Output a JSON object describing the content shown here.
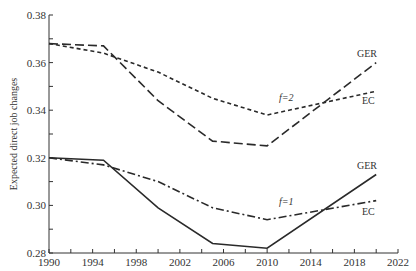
{
  "chart_data": {
    "type": "line",
    "title": "",
    "xlabel": "",
    "ylabel": "Expected direct job changes",
    "xlim": [
      1990,
      2022
    ],
    "ylim": [
      0.28,
      0.38
    ],
    "grid": false,
    "x_ticks": [
      "1990",
      "1994",
      "1998",
      "2002",
      "2006",
      "2010",
      "2014",
      "2018",
      "2022"
    ],
    "y_ticks": [
      "0.28",
      "0.30",
      "0.32",
      "0.34",
      "0.36",
      "0.38"
    ],
    "x": [
      1990,
      1995,
      2000,
      2005,
      2010,
      2020
    ],
    "series": [
      {
        "name": "GER (f=2)",
        "group": "f=2",
        "style": "long-dash",
        "values": [
          0.368,
          0.367,
          0.344,
          0.327,
          0.325,
          0.36
        ]
      },
      {
        "name": "EC (f=2)",
        "group": "f=2",
        "style": "short-dash",
        "values": [
          0.368,
          0.364,
          0.356,
          0.345,
          0.338,
          0.348
        ]
      },
      {
        "name": "GER (f=1)",
        "group": "f=1",
        "style": "solid",
        "values": [
          0.32,
          0.319,
          0.299,
          0.284,
          0.282,
          0.313
        ]
      },
      {
        "name": "EC (f=1)",
        "group": "f=1",
        "style": "dash-dot",
        "values": [
          0.32,
          0.317,
          0.31,
          0.299,
          0.294,
          0.302
        ]
      }
    ],
    "annotations": [
      {
        "text": "GER",
        "near": "GER (f=2)"
      },
      {
        "text": "EC",
        "near": "EC (f=2)"
      },
      {
        "text": "f=2",
        "near": "f=2 curves"
      },
      {
        "text": "GER",
        "near": "GER (f=1)"
      },
      {
        "text": "EC",
        "near": "EC (f=1)"
      },
      {
        "text": "f=1",
        "near": "f=1 curves"
      }
    ]
  },
  "labels": {
    "ylabel": "Expected direct job changes",
    "ger_top": "GER",
    "ec_top": "EC",
    "f2": "f=2",
    "ger_bottom": "GER",
    "ec_bottom": "EC",
    "f1": "f=1"
  }
}
